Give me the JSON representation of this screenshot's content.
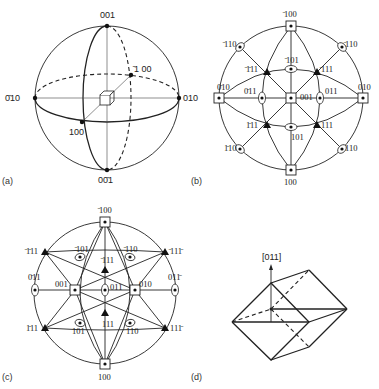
{
  "figure": {
    "panels": [
      {
        "id": "a",
        "caption": "(a)",
        "description": "Reference sphere with cubic crystal at center",
        "labels": {
          "top": "001",
          "bottom": "00̄1",
          "left": "0̄10",
          "right": "010",
          "front": "100",
          "back": "̄1 00"
        }
      },
      {
        "id": "b",
        "caption": "(b)",
        "description": "Stereographic projection, [001] at centre",
        "labels": {
          "top": "̄100",
          "bottom": "100",
          "left": "0̄10",
          "right": "010",
          "center": "001",
          "ul": "̄110",
          "ur": "̄110",
          "ll": "1̄10",
          "lr": "110",
          "i_ul": "̄1̄11",
          "i_ur": "̄111",
          "i_ll": "1̄11",
          "i_lr": "111",
          "i_top": "̄101",
          "i_bottom": "101",
          "i_left": "0̄11",
          "i_right": "011"
        }
      },
      {
        "id": "c",
        "caption": "(c)",
        "description": "Stereographic projection, [011] at centre",
        "labels": {
          "top": "̄100",
          "bottom": "100",
          "left": "0̄11",
          "right": "011̄",
          "center": "011",
          "l_sq": "001",
          "r_sq": "010",
          "ul": "̄1̄11",
          "ur": "̄111̄",
          "ll": "1̄11",
          "lr": "111̄",
          "i_ul": "̄101",
          "i_ur": "̄110",
          "i_top": "̄111",
          "i_bottom": "111",
          "i_ll": "101",
          "i_lr": "110"
        }
      },
      {
        "id": "d",
        "caption": "(d)",
        "description": "Rhombic dodecahedron viewed along [011]",
        "labels": {
          "axis": "[011]"
        }
      }
    ]
  }
}
